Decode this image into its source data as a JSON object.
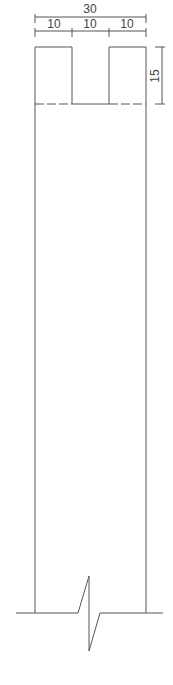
{
  "drawing": {
    "type": "wall cross-section with U-shaped top notch",
    "dimensions": {
      "overall_width": "30",
      "segments": [
        "10",
        "10",
        "10"
      ],
      "notch_depth": "15"
    },
    "colors": {
      "line": "#555555",
      "text": "#444444",
      "background": "#ffffff"
    }
  }
}
